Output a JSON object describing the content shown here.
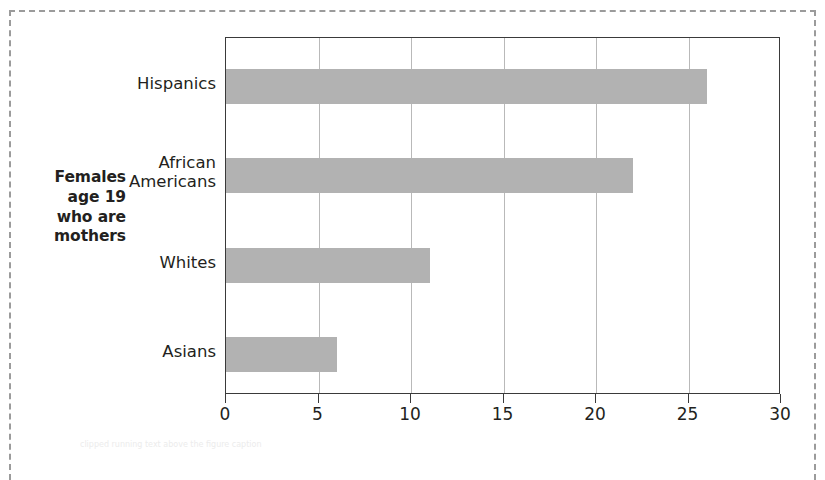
{
  "figure": {
    "axis_title_lines": [
      "Females",
      "age 19",
      "who are",
      "mothers"
    ],
    "caption_label": "FIGURE",
    "caption_ghost": "clipped running text above the figure caption"
  },
  "chart_data": {
    "type": "bar",
    "orientation": "horizontal",
    "title": "",
    "subtitle": "",
    "xlabel": "",
    "ylabel": "Females age 19 who are mothers",
    "categories": [
      "Hispanics",
      "African Americans",
      "Whites",
      "Asians"
    ],
    "category_label_lines": [
      [
        "Hispanics"
      ],
      [
        "African",
        "Americans"
      ],
      [
        "Whites"
      ],
      [
        "Asians"
      ]
    ],
    "values": [
      26,
      22,
      11,
      6
    ],
    "xlim": [
      0,
      30
    ],
    "xticks": [
      0,
      5,
      10,
      15,
      20,
      25,
      30
    ],
    "xtick_labels": [
      "0",
      "5",
      "10",
      "15",
      "20",
      "25",
      "30"
    ],
    "grid": "vertical",
    "legend": "none",
    "bar_color": "#b2b2b2",
    "axis_color": "#3a3a3a",
    "gridline_color": "#b9b9b9",
    "text_color": "#231f20"
  }
}
